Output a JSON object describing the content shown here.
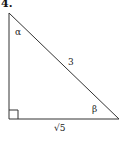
{
  "problem_number": "4.",
  "triangle": {
    "angle_top": "α",
    "angle_right": "β",
    "hypotenuse": "3",
    "base": "√5",
    "right_angle": "bottom-left"
  }
}
